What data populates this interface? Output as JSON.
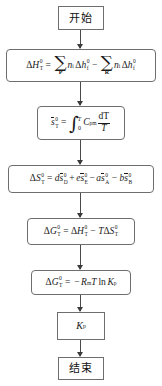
{
  "diagram": {
    "language": "zh-CN",
    "line_color": "#6e6e6e",
    "arrow_color": "#3a3a3a",
    "background": "#ffffff"
  },
  "nodes": {
    "start": {
      "label": "开始",
      "shape": "terminator"
    },
    "enthalpy": {
      "shape": "process",
      "lhs_delta": "Δ",
      "lhs_H": "H",
      "lhs_sup": "0",
      "lhs_sub": "T",
      "equals": "=",
      "sum1_glyph": "∑",
      "sum1_limit": "P",
      "n1": "n",
      "n1_sub": "i",
      "d1": "Δ",
      "h1": "h",
      "h1_sup": "0",
      "h1_sub": "f",
      "minus": "−",
      "sum2_glyph": "∑",
      "sum2_limit": "R",
      "n2": "n",
      "n2_sub": "i",
      "d2": "Δ",
      "h2": "h",
      "h2_sup": "0",
      "h2_sub": "f"
    },
    "entropy_molar": {
      "shape": "process",
      "s": "s",
      "s_sup": "0",
      "s_sub": "T",
      "equals": "=",
      "integral": "∫",
      "upper_limit": "T",
      "lower_limit": "0",
      "C": "C",
      "C_sub": "pm",
      "num": "dT",
      "den": "T"
    },
    "entropy_change": {
      "shape": "process",
      "lhs_delta": "Δ",
      "lhs_S": "S",
      "lhs_sup": "0",
      "lhs_sub": "T",
      "equals": "=",
      "t1_coef": "d",
      "t1_s": "s",
      "t1_sup": "0",
      "t1_sub": "D",
      "plus": "+",
      "t2_coef": "e",
      "t2_s": "s",
      "t2_sup": "0",
      "t2_sub": "E",
      "minus1": "−",
      "t3_coef": "a",
      "t3_s": "s",
      "t3_sup": "0",
      "t3_sub": "A",
      "minus2": "−",
      "t4_coef": "b",
      "t4_s": "s",
      "t4_sup": "0",
      "t4_sub": "B"
    },
    "gibbs": {
      "shape": "process",
      "G_delta": "Δ",
      "G": "G",
      "G_sup": "0",
      "G_sub": "T",
      "equals": "=",
      "H_delta": "Δ",
      "H": "H",
      "H_sup": "0",
      "H_sub": "T",
      "minus": "−",
      "T": "T",
      "S_delta": "Δ",
      "S": "S",
      "S_sup": "0",
      "S_sub": "T"
    },
    "gibbs_kp": {
      "shape": "process",
      "G_delta": "Δ",
      "G": "G",
      "G_sup": "0",
      "G_sub": "T",
      "equals": "=",
      "minus": "−",
      "R": "R",
      "R_sub": "m",
      "T": "T",
      "ln": "ln",
      "K": "K",
      "K_sub": "p"
    },
    "kp_result": {
      "shape": "plain",
      "K": "K",
      "K_sub": "p"
    },
    "end": {
      "label": "结束",
      "shape": "terminator"
    }
  }
}
